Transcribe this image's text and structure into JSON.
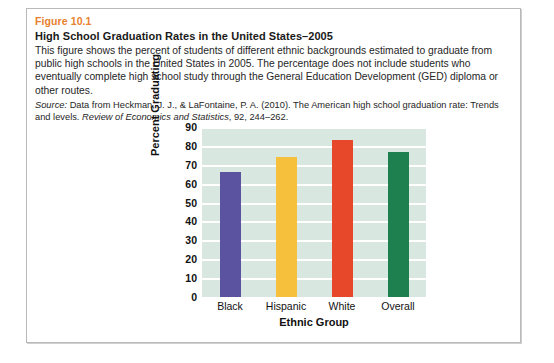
{
  "figure": {
    "number": "Figure 10.1",
    "title": "High School Graduation Rates in the United States–2005",
    "description": "This figure shows the percent of students of different ethnic backgrounds estimated to graduate from public high schools in the United States in 2005. The percentage does not include students who eventually complete high school study through the General Education Development (GED) diploma or other routes.",
    "source_label": "Source:",
    "source_text_1": " Data from Heckman, J. J., & LaFontaine, P. A. (2010). The American high school graduation rate: Trends and levels. ",
    "source_journal": "Review of Economics and Statistics",
    "source_text_2": ", 92, 244–262."
  },
  "colors": {
    "figure_number": "#e8812e",
    "plot_background": "#d8e8e1",
    "gridline": "#ffffff",
    "bar_black": "#5b53a0",
    "bar_hispanic": "#f7c03c",
    "bar_white": "#e8482a",
    "bar_overall": "#1e7f4f"
  },
  "chart_data": {
    "type": "bar",
    "title": "High School Graduation Rates in the United States–2005",
    "categories": [
      "Black",
      "Hispanic",
      "White",
      "Overall"
    ],
    "values": [
      66,
      74,
      83,
      77
    ],
    "colors": [
      "#5b53a0",
      "#f7c03c",
      "#e8482a",
      "#1e7f4f"
    ],
    "xlabel": "Ethnic Group",
    "ylabel": "Percent Graduating",
    "ylim": [
      0,
      90
    ],
    "ytick_step": 10,
    "yticks": [
      "90",
      "80",
      "70",
      "60",
      "50",
      "40",
      "30",
      "20",
      "10",
      "0"
    ],
    "grid": true,
    "legend": "none"
  }
}
